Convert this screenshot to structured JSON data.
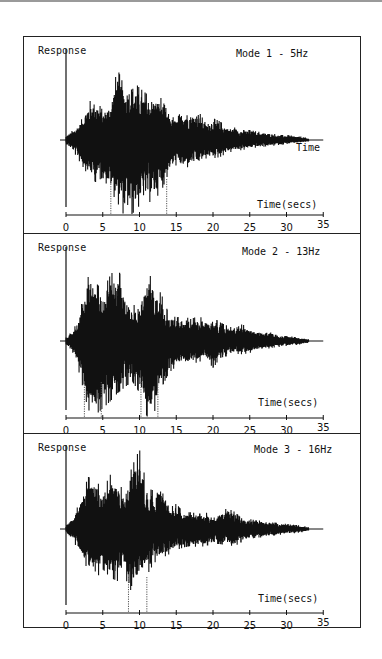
{
  "chart_data": [
    {
      "type": "line",
      "title": "Mode 1 - 5Hz",
      "ylabel": "Response",
      "xlabel": "Time (secs)",
      "trace_label": "Time",
      "xlim": [
        0,
        35
      ],
      "xticks": [
        0,
        5,
        10,
        15,
        20,
        25,
        30,
        35
      ],
      "signal_duration": 33,
      "peak_envelope": {
        "t": [
          0,
          1,
          2,
          3,
          4,
          5,
          6,
          7,
          8,
          9,
          10,
          11,
          12,
          13,
          14,
          15,
          16,
          17,
          18,
          19,
          20,
          21,
          22,
          23,
          24,
          25,
          26,
          27,
          28,
          29,
          30,
          31,
          32,
          33
        ],
        "upper": [
          0.05,
          0.12,
          0.22,
          0.45,
          0.5,
          0.35,
          0.45,
          0.85,
          0.62,
          0.72,
          0.62,
          0.55,
          0.52,
          0.5,
          0.3,
          0.25,
          0.38,
          0.32,
          0.35,
          0.2,
          0.26,
          0.22,
          0.15,
          0.15,
          0.12,
          0.12,
          0.1,
          0.09,
          0.08,
          0.06,
          0.06,
          0.05,
          0.04,
          0.02
        ],
        "lower": [
          0.05,
          0.14,
          0.28,
          0.42,
          0.5,
          0.45,
          0.6,
          0.75,
          0.92,
          0.88,
          0.78,
          0.75,
          0.72,
          0.6,
          0.38,
          0.3,
          0.35,
          0.3,
          0.3,
          0.22,
          0.22,
          0.2,
          0.15,
          0.13,
          0.12,
          0.1,
          0.09,
          0.08,
          0.07,
          0.06,
          0.05,
          0.04,
          0.03,
          0.02
        ]
      },
      "markers": [
        6.1,
        13.7
      ]
    },
    {
      "type": "line",
      "title": "Mode 2 - 13Hz",
      "ylabel": "Response",
      "xlabel": "Time (secs)",
      "xlim": [
        0,
        35
      ],
      "xticks": [
        0,
        5,
        10,
        15,
        20,
        25,
        30,
        35
      ],
      "signal_duration": 33,
      "peak_envelope": {
        "t": [
          0,
          1,
          2,
          3,
          4,
          5,
          6,
          7,
          8,
          9,
          10,
          11,
          12,
          13,
          14,
          15,
          16,
          17,
          18,
          19,
          20,
          21,
          22,
          23,
          24,
          25,
          26,
          27,
          28,
          29,
          30,
          31,
          32,
          33
        ],
        "upper": [
          0.05,
          0.12,
          0.38,
          0.92,
          0.7,
          0.6,
          0.78,
          0.9,
          0.6,
          0.42,
          0.45,
          0.82,
          0.72,
          0.55,
          0.32,
          0.28,
          0.3,
          0.26,
          0.3,
          0.25,
          0.28,
          0.22,
          0.18,
          0.15,
          0.2,
          0.14,
          0.12,
          0.12,
          0.1,
          0.08,
          0.07,
          0.05,
          0.04,
          0.02
        ],
        "lower": [
          0.05,
          0.15,
          0.45,
          0.82,
          0.88,
          0.8,
          0.72,
          0.62,
          0.55,
          0.48,
          0.62,
          0.9,
          0.85,
          0.55,
          0.38,
          0.3,
          0.3,
          0.28,
          0.25,
          0.22,
          0.32,
          0.2,
          0.18,
          0.15,
          0.16,
          0.14,
          0.12,
          0.1,
          0.08,
          0.07,
          0.06,
          0.05,
          0.04,
          0.02
        ]
      },
      "markers": [
        2.5,
        4.8,
        10.2,
        12.5
      ]
    },
    {
      "type": "line",
      "title": "Mode 3 - 16Hz",
      "ylabel": "Response",
      "xlabel": "Time (secs)",
      "xlim": [
        0,
        35
      ],
      "xticks": [
        0,
        5,
        10,
        15,
        20,
        25,
        30,
        35
      ],
      "signal_duration": 33,
      "peak_envelope": {
        "t": [
          0,
          1,
          2,
          3,
          4,
          5,
          6,
          7,
          8,
          9,
          10,
          11,
          12,
          13,
          14,
          15,
          16,
          17,
          18,
          19,
          20,
          21,
          22,
          23,
          24,
          25,
          26,
          27,
          28,
          29,
          30,
          31,
          32,
          33
        ],
        "upper": [
          0.05,
          0.15,
          0.35,
          0.62,
          0.6,
          0.45,
          0.65,
          0.55,
          0.45,
          0.75,
          0.95,
          0.5,
          0.45,
          0.58,
          0.25,
          0.3,
          0.2,
          0.2,
          0.18,
          0.2,
          0.15,
          0.2,
          0.25,
          0.2,
          0.12,
          0.12,
          0.1,
          0.1,
          0.08,
          0.07,
          0.06,
          0.05,
          0.04,
          0.02
        ],
        "lower": [
          0.05,
          0.15,
          0.3,
          0.5,
          0.6,
          0.48,
          0.58,
          0.62,
          0.52,
          0.95,
          0.55,
          0.55,
          0.4,
          0.35,
          0.3,
          0.25,
          0.22,
          0.2,
          0.22,
          0.2,
          0.18,
          0.18,
          0.2,
          0.2,
          0.15,
          0.12,
          0.1,
          0.1,
          0.08,
          0.07,
          0.06,
          0.05,
          0.04,
          0.02
        ]
      },
      "markers": [
        8.5,
        11.0
      ]
    }
  ],
  "panels": [
    {
      "ylabel": "Response",
      "title": "Mode 1 - 5Hz",
      "xlabel": "Time(secs)",
      "trace_label": "Time"
    },
    {
      "ylabel": "Response",
      "title": "Mode 2 - 13Hz",
      "xlabel": "Time(secs)"
    },
    {
      "ylabel": "Response",
      "title": "Mode 3 - 16Hz",
      "xlabel": "Time(secs)"
    }
  ],
  "colors": {
    "ink": "#111111",
    "border": "#222222",
    "background": "#ffffff",
    "marker": "#555555"
  }
}
